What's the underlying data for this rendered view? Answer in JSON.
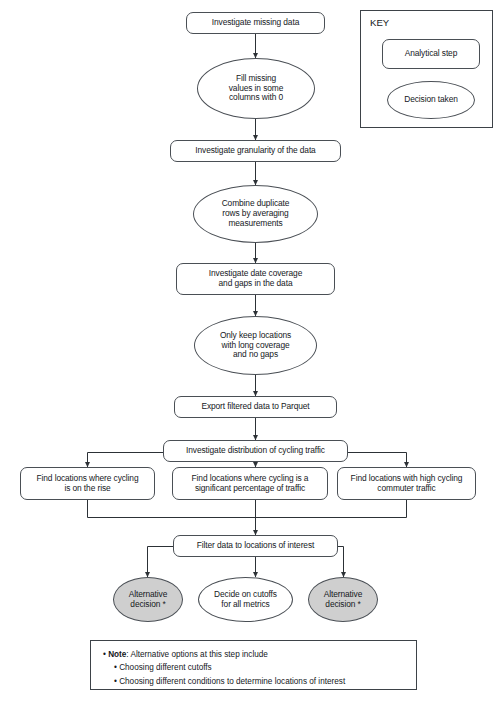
{
  "diagram": {
    "colors": {
      "stroke": "#4a4f55",
      "shaded_fill": "#cfcfcf",
      "plain_fill": "#ffffff",
      "text": "#15181c"
    },
    "nodes": [
      {
        "id": "n1",
        "type": "step",
        "shaded": false,
        "lines": [
          "Investigate missing data"
        ]
      },
      {
        "id": "n2",
        "type": "decision",
        "shaded": false,
        "lines": [
          "Fill missing",
          "values in some",
          "columns with 0"
        ]
      },
      {
        "id": "n3",
        "type": "step",
        "shaded": false,
        "lines": [
          "Investigate granularity of the data"
        ]
      },
      {
        "id": "n4",
        "type": "decision",
        "shaded": false,
        "lines": [
          "Combine duplicate",
          "rows by averaging",
          "measurements"
        ]
      },
      {
        "id": "n5",
        "type": "step",
        "shaded": false,
        "lines": [
          "Investigate date coverage",
          "and gaps in the data"
        ]
      },
      {
        "id": "n6",
        "type": "decision",
        "shaded": false,
        "lines": [
          "Only keep locations",
          "with long coverage",
          "and no gaps"
        ]
      },
      {
        "id": "n7",
        "type": "step",
        "shaded": false,
        "lines": [
          "Export filtered data to Parquet"
        ]
      },
      {
        "id": "n8",
        "type": "step",
        "shaded": false,
        "lines": [
          "Investigate distribution of cycling traffic"
        ]
      },
      {
        "id": "n9",
        "type": "step",
        "shaded": false,
        "lines": [
          "Find locations where cycling",
          "is on the rise"
        ]
      },
      {
        "id": "n10",
        "type": "step",
        "shaded": false,
        "lines": [
          "Find locations where cycling is a",
          "significant percentage of traffic"
        ]
      },
      {
        "id": "n11",
        "type": "step",
        "shaded": false,
        "lines": [
          "Find locations with high cycling",
          "commuter traffic"
        ]
      },
      {
        "id": "n12",
        "type": "step",
        "shaded": false,
        "lines": [
          "Filter data to locations of interest"
        ]
      },
      {
        "id": "n13",
        "type": "decision",
        "shaded": true,
        "lines": [
          "Alternative",
          "decision *"
        ]
      },
      {
        "id": "n14",
        "type": "decision",
        "shaded": false,
        "lines": [
          "Decide on cutoffs",
          "for all metrics"
        ]
      },
      {
        "id": "n15",
        "type": "decision",
        "shaded": true,
        "lines": [
          "Alternative",
          "decision *"
        ]
      }
    ]
  },
  "key": {
    "title": "KEY",
    "step_label": "Analytical step",
    "decision_label": "Decision taken"
  },
  "note": {
    "bullet": "•",
    "line1_strong": "Note",
    "line1_rest": ": Alternative options at this step include",
    "line2": "Choosing different cutoffs",
    "line3": "Choosing different conditions to determine locations of interest"
  }
}
